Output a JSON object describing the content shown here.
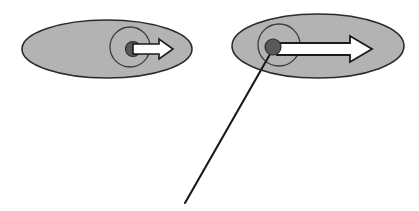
{
  "canvas": {
    "width": 419,
    "height": 211,
    "background": "#ffffff",
    "title": "Two ellipse objects with central dots and velocity arrows"
  },
  "palette": {
    "ellipse_fill": "#b3b3b3",
    "ellipse_stroke": "#2b2b2b",
    "inner_circle_stroke": "#3a3a3a",
    "inner_circle_fill": "none",
    "dot_fill": "#595959",
    "dot_stroke": "#2b2b2b",
    "arrow_fill": "#ffffff",
    "arrow_stroke": "#1a1a1a",
    "leader_line_stroke": "#1a1a1a"
  },
  "objects": [
    {
      "id": "left",
      "label": "left-object",
      "ellipse": {
        "cx": 107,
        "cy": 49,
        "rx": 85,
        "ry": 29,
        "stroke_width": 1.6
      },
      "inner_circle": {
        "cx": 130,
        "cy": 47,
        "r": 20,
        "stroke_width": 1.3
      },
      "dot": {
        "cx": 133,
        "cy": 49,
        "r": 7.5,
        "stroke_width": 1.2
      },
      "arrow": {
        "x_start": 133,
        "x_tip": 173,
        "y": 49,
        "shaft_half_height": 5,
        "head_half_height": 10,
        "head_length": 14,
        "stroke_width": 1.6,
        "length": 40,
        "direction": "right"
      }
    },
    {
      "id": "right",
      "label": "right-object",
      "ellipse": {
        "cx": 318,
        "cy": 46,
        "rx": 86,
        "ry": 32,
        "stroke_width": 1.6
      },
      "inner_circle": {
        "cx": 279,
        "cy": 45,
        "r": 21,
        "stroke_width": 1.3
      },
      "dot": {
        "cx": 273,
        "cy": 47,
        "r": 8,
        "stroke_width": 1.2
      },
      "arrow": {
        "x_start": 277,
        "x_tip": 372,
        "y": 49,
        "shaft_half_height": 6,
        "head_half_height": 13,
        "head_length": 22,
        "stroke_width": 1.8,
        "length": 95,
        "direction": "right"
      }
    }
  ],
  "leader_line": {
    "label": "leader-line-from-right-dot",
    "x1": 273,
    "y1": 49,
    "x2": 185,
    "y2": 203,
    "stroke_width": 2.1
  }
}
